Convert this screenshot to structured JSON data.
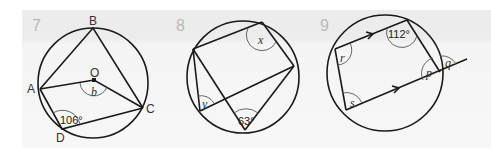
{
  "problems": [
    {
      "number": "7",
      "vertices": {
        "A": "A",
        "B": "B",
        "C": "C",
        "D": "D",
        "O": "O"
      },
      "angles": {
        "given": "106°",
        "unknown": "b"
      }
    },
    {
      "number": "8",
      "angles": {
        "given": "63°",
        "unknown_top": "x",
        "unknown_left": "y"
      }
    },
    {
      "number": "9",
      "angles": {
        "given": "112°",
        "r": "r",
        "s": "s",
        "p": "p",
        "q": "q"
      }
    }
  ],
  "colors": {
    "ink": "#1a1a1a",
    "number": "#b9b9b9",
    "panel": "#efefef"
  }
}
